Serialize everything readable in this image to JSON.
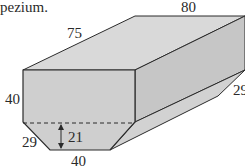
{
  "caption_fragment": "pezium.",
  "labels": {
    "length": "80",
    "top_edge": "75",
    "front_height": "40",
    "slant_left": "29",
    "slant_right": "29",
    "trapezium_height": "21",
    "bottom_base": "40"
  },
  "colors": {
    "front_face": "#cfcfcf",
    "top_face": "#d9d9d9",
    "right_face": "#c6c6c6",
    "slant_face": "#d2d2d2",
    "edge": "#2b2b2b"
  }
}
